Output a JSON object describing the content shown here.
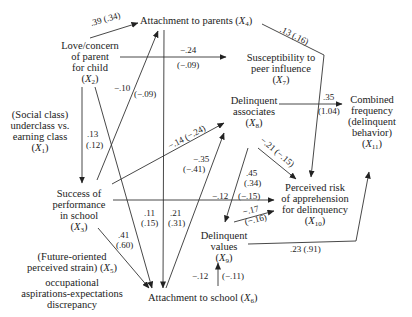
{
  "diagram": {
    "type": "path-diagram",
    "nodes": {
      "x1": {
        "id": "X1",
        "lines": [
          "(Social class)",
          "underclass vs.",
          "earning class"
        ],
        "var": "X",
        "sub": "1"
      },
      "x2": {
        "id": "X2",
        "lines": [
          "Love/concern",
          "of parent",
          "for child"
        ],
        "var": "X",
        "sub": "2"
      },
      "x3": {
        "id": "X3",
        "lines": [
          "Success of",
          "performance",
          "in school"
        ],
        "var": "X",
        "sub": "3"
      },
      "x4": {
        "id": "X4",
        "label": "Attachment to parents",
        "var": "X",
        "sub": "4"
      },
      "x5": {
        "id": "X5",
        "line1": "(Future-oriented",
        "line2": "perceived strain)",
        "var": "X",
        "sub": "5",
        "line3": "occupational",
        "line4": "aspirations-expectations",
        "line5": "discrepancy"
      },
      "x6": {
        "id": "X6",
        "label": "Attachment to school",
        "var": "X",
        "sub": "6"
      },
      "x7": {
        "id": "X7",
        "lines": [
          "Susceptibility to",
          "peer influence"
        ],
        "var": "X",
        "sub": "7"
      },
      "x8": {
        "id": "X8",
        "lines": [
          "Delinquent",
          "associates"
        ],
        "var": "X",
        "sub": "8"
      },
      "x9": {
        "id": "X9",
        "lines": [
          "Delinquent",
          "values"
        ],
        "var": "X",
        "sub": "9"
      },
      "x10": {
        "id": "X10",
        "lines": [
          "Perceived risk",
          "of apprehension",
          "for delinquency"
        ],
        "var": "X",
        "sub": "10"
      },
      "x11": {
        "id": "X11",
        "lines": [
          "Combined",
          "frequency",
          "(delinquent",
          "behavior)"
        ],
        "var": "X",
        "sub": "11"
      }
    },
    "edges": [
      {
        "from": "X2",
        "to": "X4",
        "coef": ".39 (.34)"
      },
      {
        "from": "X4",
        "to": "X10",
        "coef": ".13 (.16)"
      },
      {
        "from": "X2",
        "to": "X7",
        "coef_top": "−.24",
        "coef_bottom": "(−.09)"
      },
      {
        "from": "X3",
        "to": "X4",
        "coef_top": "−.10",
        "coef_bottom": "(−.09)"
      },
      {
        "from": "X1",
        "to": "X3",
        "coef_top": ".13",
        "coef_bottom": "(.12)"
      },
      {
        "from": "X3",
        "to": "X8",
        "coef": "−.14 (−.24)"
      },
      {
        "from": "X6",
        "to": "X8",
        "coef_top": "−.35",
        "coef_bottom": "(−.41)"
      },
      {
        "from": "X8",
        "to": "X11",
        "coef_top": ".35",
        "coef_bottom": "(1.04)"
      },
      {
        "from": "X8",
        "to": "X10",
        "coef": "−.21 (−.15)"
      },
      {
        "from": "X8",
        "to": "X9",
        "coef_top": ".45",
        "coef_bottom": "(.34)"
      },
      {
        "from": "X3",
        "to": "X10",
        "coef_top": "−.12",
        "coef_bottom": "(−.15)"
      },
      {
        "from": "X9",
        "to": "X10",
        "coef_top": "−.17",
        "coef_bottom": "(−.16)"
      },
      {
        "from": "X9",
        "to": "X11",
        "coef": ".23 (.91)"
      },
      {
        "from": "X2",
        "to": "X6",
        "coef_top": ".11",
        "coef_bottom": "(.15)"
      },
      {
        "from": "X4",
        "to": "X6",
        "coef_top": ".21",
        "coef_bottom": "(.31)"
      },
      {
        "from": "X3",
        "to": "X6",
        "coef_top": ".41",
        "coef_bottom": "(.60)"
      },
      {
        "from": "X6",
        "to": "X9",
        "coef_top": "−.12",
        "coef_bottom": "(−.11)"
      }
    ]
  }
}
